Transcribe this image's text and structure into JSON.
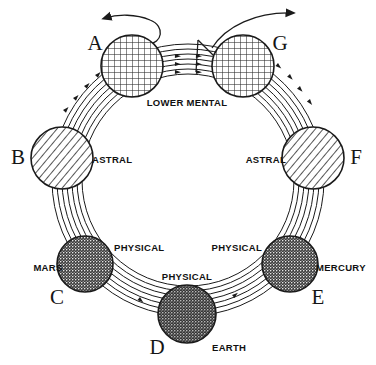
{
  "diagram": {
    "background_color": "#ffffff",
    "ink_color": "#1a1a1a",
    "band": {
      "line_count": 7,
      "description": "seven concentric arc lines with small directional arrowheads forming the chain path"
    },
    "arrows": [
      {
        "id": "arrow-in-left",
        "label": "",
        "direction": "leftward-hook-into-globe-a"
      },
      {
        "id": "arrow-out-right",
        "label": "",
        "direction": "rightward-out-of-globe-g"
      }
    ],
    "globes": [
      {
        "letter": "A",
        "plane_label": "",
        "planet_label": "",
        "fill_style": "cross-hatch",
        "cx": 132,
        "cy": 66,
        "r": 31,
        "letter_x": 95,
        "letter_y": 50,
        "shade": "#cfcfcf"
      },
      {
        "letter": "B",
        "plane_label": "ASTRAL",
        "planet_label": "",
        "fill_style": "diagonal-hatch",
        "cx": 62,
        "cy": 158,
        "r": 31,
        "letter_x": 16,
        "letter_y": 164,
        "label_x": 92,
        "label_y": 163,
        "shade": "#bdbdbd"
      },
      {
        "letter": "C",
        "plane_label": "PHYSICAL",
        "planet_label": "MARS",
        "fill_style": "stipple-dark",
        "cx": 85,
        "cy": 264,
        "r": 28,
        "letter_x": 57,
        "letter_y": 302,
        "label_x": 116,
        "label_y": 251,
        "planet_x": 20,
        "planet_y": 270,
        "shade": "#5a5a5a"
      },
      {
        "letter": "D",
        "plane_label": "PHYSICAL",
        "planet_label": "EARTH",
        "fill_style": "stipple-dark",
        "cx": 187,
        "cy": 314,
        "r": 29,
        "letter_x": 155,
        "letter_y": 352,
        "label_x": 160,
        "label_y": 279,
        "planet_x": 214,
        "planet_y": 349,
        "shade": "#4d4d4d"
      },
      {
        "letter": "E",
        "plane_label": "PHYSICAL",
        "planet_label": "MERCURY",
        "fill_style": "stipple-dark",
        "cx": 290,
        "cy": 264,
        "r": 28,
        "letter_x": 315,
        "letter_y": 302,
        "label_x": 196,
        "label_y": 251,
        "planet_x": 318,
        "planet_y": 270,
        "shade": "#5a5a5a"
      },
      {
        "letter": "F",
        "plane_label": "ASTRAL",
        "planet_label": "",
        "fill_style": "diagonal-hatch",
        "cx": 313,
        "cy": 158,
        "r": 31,
        "letter_x": 348,
        "letter_y": 164,
        "label_x": 236,
        "label_y": 163,
        "shade": "#bdbdbd"
      },
      {
        "letter": "G",
        "plane_label": "",
        "planet_label": "",
        "fill_style": "cross-hatch",
        "cx": 243,
        "cy": 66,
        "r": 31,
        "letter_x": 272,
        "letter_y": 50,
        "shade": "#cfcfcf"
      }
    ],
    "shared_labels": [
      {
        "id": "lower-mental",
        "text": "LOWER MENTAL",
        "x": 187,
        "y": 104
      }
    ]
  }
}
